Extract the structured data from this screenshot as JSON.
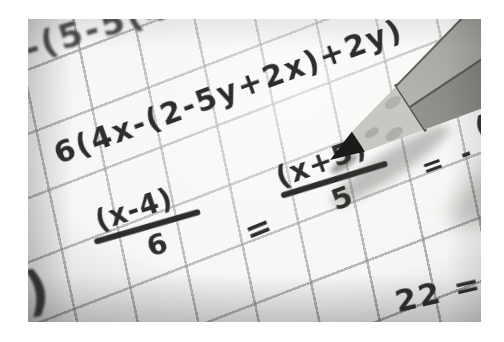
{
  "scene": {
    "description": "Black-and-white close-up photo of handwritten algebra equations on graph paper with a sharpened pencil",
    "background_color": "#ffffff",
    "paper_color": "#f4f4f2",
    "grid_line_color": "#9b9c99",
    "ink_color": "#2d2d2b"
  },
  "equations": {
    "top_line": "-(5-5(4",
    "main_line": "6(4x-(2-5y+2x)+2y)",
    "fraction_left": {
      "numerator": "(x-4)",
      "denominator": "6"
    },
    "equals_middle": "=",
    "fraction_right": {
      "numerator": "(x+5)",
      "denominator": "5"
    },
    "equals_right": "= -",
    "partial_right_edge": "(",
    "bottom_right": "22 =(",
    "bottom_left_paren": ")"
  },
  "pencil": {
    "tip_color": "#1b1b19",
    "wood_color": "#c8c8c3",
    "wood_shade_color": "#a5a5a0",
    "collar_color": "#555450",
    "facet_light_start": "#b3b3af",
    "facet_light_end": "#7b7c78",
    "facet_dark_start": "#93938f",
    "facet_dark_end": "#4f4f4d",
    "edge_color": "#5e5e5a",
    "shadow_color": "#3c3c3a"
  }
}
